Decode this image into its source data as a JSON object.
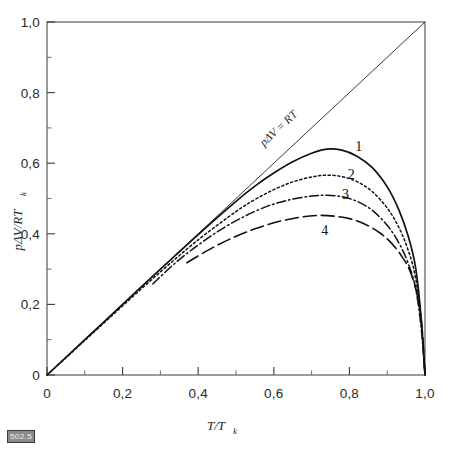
{
  "chart_data": {
    "type": "line",
    "title": "",
    "xlabel": "T/T_k",
    "ylabel": "pΔV/RT_k",
    "xlabel_main": "T/T",
    "xlabel_sub": "k",
    "ylabel_main": "pΔV/RT",
    "ylabel_sub": "k",
    "xlim": [
      0,
      1.0
    ],
    "ylim": [
      0,
      1.0
    ],
    "grid": false,
    "legend_position": "inline-curve-labels",
    "xticks": [
      0,
      0.2,
      0.4,
      0.6,
      0.8,
      1.0
    ],
    "xticklabels": [
      "0",
      "0,2",
      "0,4",
      "0,6",
      "0,8",
      "1,0"
    ],
    "yticks": [
      0,
      0.2,
      0.4,
      0.6,
      0.8,
      1.0
    ],
    "yticklabels": [
      "0",
      "0,2",
      "0,4",
      "0,6",
      "0,8",
      "1,0"
    ],
    "annotations": [
      {
        "name": "diagonal-line-label",
        "text": "pΔV = RT",
        "x": 0.62,
        "y": 0.66,
        "rotation": -43
      }
    ],
    "series": [
      {
        "name": "1",
        "label": "1",
        "style": "solid",
        "label_x": 0.825,
        "label_y": 0.635,
        "x": [
          0.0,
          0.1,
          0.2,
          0.3,
          0.4,
          0.5,
          0.55,
          0.6,
          0.65,
          0.7,
          0.74,
          0.78,
          0.82,
          0.86,
          0.9,
          0.93,
          0.955,
          0.975,
          0.99,
          1.0
        ],
        "y": [
          0.0,
          0.1,
          0.2,
          0.3,
          0.398,
          0.492,
          0.535,
          0.572,
          0.604,
          0.628,
          0.64,
          0.637,
          0.62,
          0.588,
          0.533,
          0.47,
          0.395,
          0.305,
          0.16,
          0.0
        ]
      },
      {
        "name": "2",
        "label": "2",
        "style": "dotted",
        "label_x": 0.805,
        "label_y": 0.555,
        "x": [
          0.0,
          0.1,
          0.2,
          0.3,
          0.4,
          0.5,
          0.55,
          0.6,
          0.65,
          0.7,
          0.74,
          0.78,
          0.82,
          0.86,
          0.9,
          0.93,
          0.955,
          0.975,
          0.99,
          1.0
        ],
        "y": [
          0.0,
          0.098,
          0.196,
          0.292,
          0.383,
          0.463,
          0.497,
          0.525,
          0.547,
          0.561,
          0.566,
          0.562,
          0.548,
          0.52,
          0.473,
          0.42,
          0.355,
          0.276,
          0.148,
          0.0
        ]
      },
      {
        "name": "3",
        "label": "3",
        "style": "dash-dot",
        "label_x": 0.79,
        "label_y": 0.498,
        "x": [
          0.28,
          0.34,
          0.4,
          0.46,
          0.52,
          0.58,
          0.64,
          0.7,
          0.74,
          0.78,
          0.82,
          0.86,
          0.9,
          0.93,
          0.955,
          0.975,
          0.99,
          1.0
        ],
        "y": [
          0.258,
          0.318,
          0.368,
          0.412,
          0.448,
          0.477,
          0.496,
          0.507,
          0.509,
          0.505,
          0.492,
          0.467,
          0.424,
          0.376,
          0.318,
          0.246,
          0.132,
          0.0
        ]
      },
      {
        "name": "4",
        "label": "4",
        "style": "long-dash",
        "label_x": 0.735,
        "label_y": 0.398,
        "x": [
          0.37,
          0.43,
          0.49,
          0.55,
          0.61,
          0.67,
          0.72,
          0.76,
          0.8,
          0.84,
          0.88,
          0.91,
          0.94,
          0.962,
          0.98,
          0.992,
          1.0
        ],
        "y": [
          0.318,
          0.356,
          0.388,
          0.414,
          0.434,
          0.447,
          0.452,
          0.45,
          0.443,
          0.428,
          0.403,
          0.375,
          0.334,
          0.29,
          0.224,
          0.135,
          0.0
        ]
      }
    ],
    "reference_line": {
      "name": "pdV-equals-RT",
      "label": "pΔV = RT",
      "from": [
        0,
        0
      ],
      "to": [
        1.0,
        1.0
      ],
      "style": "solid-thin"
    }
  },
  "stamp": {
    "text": "502.5"
  },
  "caption": {
    "text": ""
  }
}
